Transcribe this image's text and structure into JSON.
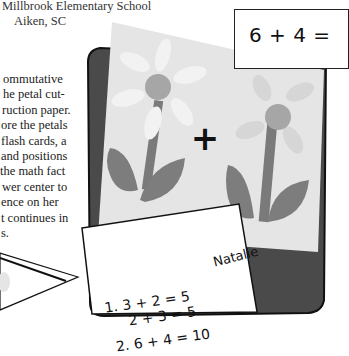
{
  "header": {
    "school": "Millbrook Elementary School",
    "city": "Aiken, SC"
  },
  "article": {
    "lines": [
      "ommutative",
      "he petal cut-",
      "ruction paper.",
      "ore the petals",
      "flash cards, a",
      "and positions",
      "the math fact",
      "wer center to",
      "ence on her",
      "t continues in",
      "s."
    ]
  },
  "photo": {
    "problem_card": "6 + 4 =",
    "plus_sign": "+",
    "student_name": "Natalie",
    "answers": [
      "1.  3 + 2 = 5",
      "2 + 3 = 5",
      "2.  6 + 4 = 10"
    ]
  },
  "colors": {
    "paper": "#e6e6e6",
    "petal": "#f0f0f0",
    "flower_center": "#a8a8a8",
    "stem_leaf": "#7f7f7f",
    "dark_board": "#4a4a4a"
  }
}
